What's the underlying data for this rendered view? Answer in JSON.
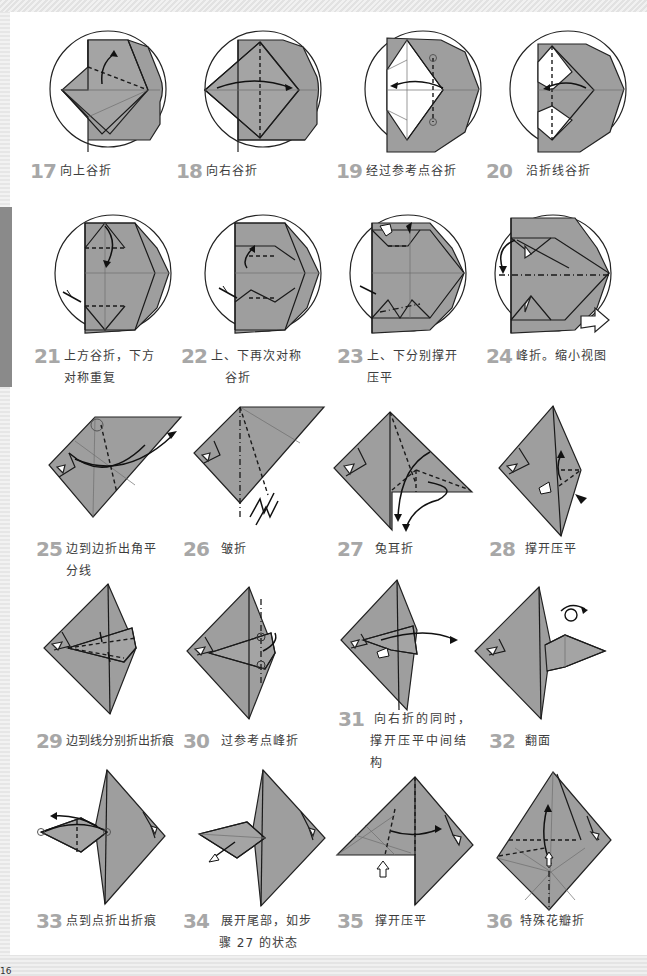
{
  "page": {
    "page_number": "16",
    "background": "#ffffff",
    "step_number_color": "#a7a7a7",
    "paper_color": "#9e9e9e"
  },
  "steps": [
    {
      "number": "17",
      "lines": [
        "向上谷折"
      ]
    },
    {
      "number": "18",
      "lines": [
        "向右谷折"
      ]
    },
    {
      "number": "19",
      "lines": [
        "经过参考点谷折"
      ]
    },
    {
      "number": "20",
      "lines": [
        "沿折线谷折"
      ]
    },
    {
      "number": "21",
      "lines": [
        "上方谷折，下方",
        "对称重复"
      ]
    },
    {
      "number": "22",
      "lines": [
        "上、下再次对称",
        "谷折"
      ]
    },
    {
      "number": "23",
      "lines": [
        "上、下分别撑开",
        "压平"
      ]
    },
    {
      "number": "24",
      "lines": [
        "峰折。缩小视图"
      ]
    },
    {
      "number": "25",
      "lines": [
        "边到边折出角平",
        "分线"
      ]
    },
    {
      "number": "26",
      "lines": [
        "皱折"
      ]
    },
    {
      "number": "27",
      "lines": [
        "兔耳折"
      ]
    },
    {
      "number": "28",
      "lines": [
        "撑开压平"
      ]
    },
    {
      "number": "29",
      "lines": [
        "边到线分别折出折痕"
      ]
    },
    {
      "number": "30",
      "lines": [
        "过参考点峰折"
      ]
    },
    {
      "number": "31",
      "lines": [
        "向右折的同时，",
        "撑开压平中间结",
        "构"
      ]
    },
    {
      "number": "32",
      "lines": [
        "翻面"
      ]
    },
    {
      "number": "33",
      "lines": [
        "点到点折出折痕"
      ]
    },
    {
      "number": "34",
      "lines": [
        "展开尾部，如步",
        "骤 27 的状态"
      ]
    },
    {
      "number": "35",
      "lines": [
        "撑开压平"
      ]
    },
    {
      "number": "36",
      "lines": [
        "特殊花瓣折"
      ]
    }
  ]
}
